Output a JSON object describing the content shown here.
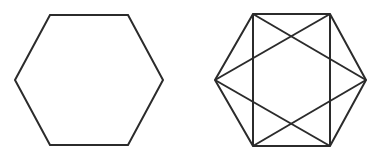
{
  "image": {
    "width": 385,
    "height": 163,
    "background_color": "#ffffff",
    "stroke_color": "#2b2b2b",
    "stroke_width": 2,
    "description": "Two line-drawn hexagon figures side by side on a plain white background"
  },
  "figures": [
    {
      "id": "plain-hexagon",
      "name": "Plain regular hexagon",
      "position": "left",
      "shape": "hexagon",
      "orientation": "flat-top",
      "fill": "none",
      "vertices": [
        {
          "label": "left",
          "x": 15,
          "y": 80
        },
        {
          "label": "top-left",
          "x": 50,
          "y": 15
        },
        {
          "label": "top-right",
          "x": 128,
          "y": 15
        },
        {
          "label": "right",
          "x": 163,
          "y": 80
        },
        {
          "label": "bottom-right",
          "x": 128,
          "y": 145
        },
        {
          "label": "bottom-left",
          "x": 50,
          "y": 145
        }
      ],
      "interior_lines": []
    },
    {
      "id": "star-hexagon",
      "name": "Hexagon with inscribed star chords",
      "position": "right",
      "shape": "hexagon",
      "orientation": "flat-top",
      "fill": "none",
      "vertices": [
        {
          "label": "left",
          "x": 215,
          "y": 80
        },
        {
          "label": "top-left",
          "x": 253,
          "y": 14
        },
        {
          "label": "top-right",
          "x": 330,
          "y": 14
        },
        {
          "label": "right",
          "x": 366,
          "y": 80
        },
        {
          "label": "bottom-right",
          "x": 330,
          "y": 146
        },
        {
          "label": "bottom-left",
          "x": 253,
          "y": 146
        }
      ],
      "interior_lines": [
        {
          "name": "left-vertical-chord",
          "from": "top-left",
          "to": "bottom-left"
        },
        {
          "name": "right-vertical-chord",
          "from": "top-right",
          "to": "bottom-right"
        },
        {
          "name": "triangle-up-side-a",
          "from": "top-left",
          "to": "right"
        },
        {
          "name": "triangle-up-side-b",
          "from": "right",
          "to": "bottom-left"
        },
        {
          "name": "triangle-up-side-c",
          "from": "bottom-left",
          "to": "top-left"
        },
        {
          "name": "triangle-down-side-a",
          "from": "top-right",
          "to": "left"
        },
        {
          "name": "triangle-down-side-b",
          "from": "left",
          "to": "bottom-right"
        },
        {
          "name": "triangle-down-side-c",
          "from": "bottom-right",
          "to": "top-right"
        }
      ]
    }
  ]
}
